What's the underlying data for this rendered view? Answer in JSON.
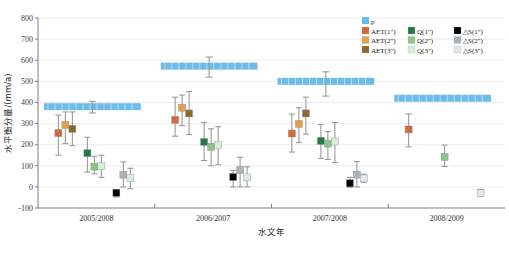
{
  "chart_data": {
    "type": "scatter",
    "title": "",
    "xlabel": "水文年",
    "ylabel": "水平衡分量/(mm/a)",
    "ylim": [
      -100,
      800
    ],
    "ytick_step": 100,
    "yticks": [
      "800",
      "700",
      "600",
      "500",
      "400",
      "300",
      "200",
      "100",
      "0",
      "-100"
    ],
    "categories": [
      "2005/2008",
      "2006/2007",
      "2007/2008",
      "2008/2009"
    ],
    "grid": true,
    "legend_position": "top-right",
    "legend": {
      "p_label": "p",
      "entries": [
        {
          "label": "AET(1\")",
          "color": "#d2693c"
        },
        {
          "label": "Q(1\")",
          "color": "#1f7a43"
        },
        {
          "label": "△S(1\")",
          "color": "#000000"
        },
        {
          "label": "AET(2\")",
          "color": "#dfa249"
        },
        {
          "label": "Q(2\")",
          "color": "#8cc48c"
        },
        {
          "label": "△S(2\")",
          "color": "#a9b3ba"
        },
        {
          "label": "AET(3\")",
          "color": "#8a6a29"
        },
        {
          "label": "Q(3\")",
          "color": "#d8f0d8"
        },
        {
          "label": "△S(3\")",
          "color": "#dceaf0"
        }
      ]
    },
    "p_color": "#6dbbe8",
    "p_bands": [
      {
        "category": "2005/2008",
        "value": 380,
        "err_low": 350,
        "err_high": 405
      },
      {
        "category": "2006/2007",
        "value": 572,
        "err_low": 520,
        "err_high": 615
      },
      {
        "category": "2007/2008",
        "value": 500,
        "err_low": 430,
        "err_high": 545
      },
      {
        "category": "2008/2009",
        "value": 420,
        "err_low": 420,
        "err_high": 420
      }
    ],
    "series": [
      {
        "name": "AET(1\")",
        "color": "#d2693c",
        "values": [
          255,
          318,
          253,
          272
        ],
        "err_low": [
          150,
          240,
          165,
          190
        ],
        "err_high": [
          340,
          425,
          345,
          345
        ]
      },
      {
        "name": "AET(2\")",
        "color": "#dfa249",
        "values": [
          293,
          375,
          298,
          null
        ],
        "err_low": [
          205,
          290,
          210,
          null
        ],
        "err_high": [
          355,
          435,
          375,
          null
        ]
      },
      {
        "name": "AET(3\")",
        "color": "#8a6a29",
        "values": [
          275,
          348,
          348,
          null
        ],
        "err_low": [
          195,
          248,
          250,
          null
        ],
        "err_high": [
          355,
          452,
          425,
          null
        ]
      },
      {
        "name": "Q(1\")",
        "color": "#1f7a43",
        "values": [
          160,
          213,
          218,
          null
        ],
        "err_low": [
          70,
          125,
          135,
          null
        ],
        "err_high": [
          235,
          305,
          295,
          null
        ]
      },
      {
        "name": "Q(2\")",
        "color": "#8cc48c",
        "values": [
          96,
          190,
          205,
          142
        ],
        "err_low": [
          62,
          100,
          130,
          97
        ],
        "err_high": [
          145,
          275,
          262,
          198
        ]
      },
      {
        "name": "Q(3\")",
        "color": "#d8f0d8",
        "values": [
          98,
          200,
          215,
          null
        ],
        "err_low": [
          45,
          105,
          115,
          null
        ],
        "err_high": [
          150,
          285,
          305,
          null
        ]
      },
      {
        "name": "△S(1\")",
        "color": "#000000",
        "values": [
          -28,
          47,
          17,
          null
        ],
        "err_low": [
          -48,
          0,
          -2,
          null
        ],
        "err_high": [
          -12,
          78,
          45,
          null
        ]
      },
      {
        "name": "△S(2\")",
        "color": "#a9b3ba",
        "values": [
          58,
          80,
          58,
          null
        ],
        "err_low": [
          0,
          0,
          0,
          null
        ],
        "err_high": [
          118,
          140,
          120,
          null
        ]
      },
      {
        "name": "△S(3\")",
        "color": "#dceaf0",
        "values": [
          42,
          45,
          40,
          -30
        ],
        "err_low": [
          -8,
          0,
          22,
          -45
        ],
        "err_high": [
          88,
          95,
          60,
          -12
        ]
      }
    ]
  }
}
